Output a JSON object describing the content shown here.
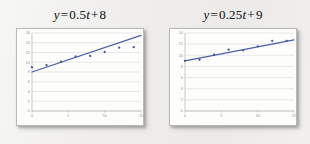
{
  "figure": {
    "background_color": "#eeedeb",
    "panel_color": "#fdfdfc",
    "accent_color": "#46589c",
    "grid_color": "#d4d3d1",
    "tick_color": "#8e8d8b"
  },
  "charts": [
    {
      "id": "left-chart",
      "title_full": "y = 0.5t + 8",
      "title_parts": {
        "lhs": "y",
        "equals": "=",
        "coefficient": "0.5",
        "variable": "t",
        "plus": "+",
        "intercept": "8"
      }
    },
    {
      "id": "right-chart",
      "title_full": "y = 0.25t + 9",
      "title_parts": {
        "lhs": "y",
        "equals": "=",
        "coefficient": "0.25",
        "variable": "t",
        "plus": "+",
        "intercept": "9"
      }
    }
  ],
  "chart_data": [
    {
      "type": "scatter",
      "title": "y = 0.5t + 8",
      "xlabel": "",
      "ylabel": "",
      "xlim": [
        0,
        15
      ],
      "ylim": [
        0,
        16
      ],
      "grid": true,
      "legend": "none",
      "xticks": [
        0,
        5,
        10,
        15
      ],
      "xtick_labels": [
        "0",
        "5",
        "10",
        "15"
      ],
      "yticks": [
        0,
        2,
        4,
        6,
        8,
        10,
        12,
        14,
        16
      ],
      "ytick_labels": [
        "0",
        "2",
        "4",
        "6",
        "8",
        "10",
        "12",
        "14",
        "16"
      ],
      "series": [
        {
          "name": "observed data",
          "marker": "dot",
          "color": "#46589c",
          "x": [
            0,
            2,
            4,
            6,
            8,
            10,
            12,
            14
          ],
          "y": [
            9.0,
            9.4,
            10.1,
            11.2,
            11.3,
            12.1,
            13.0,
            13.1
          ]
        }
      ],
      "trend_line": {
        "name": "y = 0.5t + 8",
        "color": "#4a5fa8",
        "slope": 0.5,
        "intercept": 8,
        "x_start": 0,
        "x_end": 15,
        "y_start": 8.0,
        "y_end": 15.5
      }
    },
    {
      "type": "scatter",
      "title": "y = 0.25t + 9",
      "xlabel": "",
      "ylabel": "",
      "xlim": [
        0,
        15
      ],
      "ylim": [
        0,
        14
      ],
      "grid": true,
      "legend": "none",
      "xticks": [
        0,
        5,
        10,
        15
      ],
      "xtick_labels": [
        "0",
        "5",
        "10",
        "15"
      ],
      "yticks": [
        0,
        2,
        4,
        6,
        8,
        10,
        12,
        14
      ],
      "ytick_labels": [
        "0",
        "2",
        "4",
        "6",
        "8",
        "10",
        "12",
        "14"
      ],
      "series": [
        {
          "name": "observed data",
          "marker": "dot",
          "color": "#46589c",
          "x": [
            0,
            2,
            4,
            6,
            8,
            10,
            12,
            14
          ],
          "y": [
            9.0,
            9.2,
            10.1,
            11.0,
            10.9,
            11.6,
            12.6,
            12.6
          ]
        }
      ],
      "trend_line": {
        "name": "y = 0.25t + 9",
        "color": "#4a5fa8",
        "slope": 0.25,
        "intercept": 9,
        "x_start": 0,
        "x_end": 15,
        "y_start": 9.0,
        "y_end": 12.75
      }
    }
  ]
}
